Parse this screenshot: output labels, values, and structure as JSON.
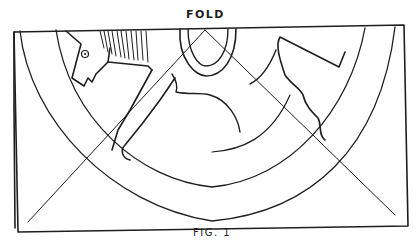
{
  "diagram": {
    "fold_label": "FOLD",
    "figure_caption": "FIG. 1",
    "colors": {
      "ink": "#1e1e1e",
      "paper": "#ffffff"
    },
    "elements": [
      "outer-border-rectangle",
      "back-sheet-edge",
      "outer-arc",
      "middle-arc",
      "inner-arc",
      "top-loop",
      "diagonal-fold-lines",
      "horse-head",
      "horse-mane",
      "horse-legs",
      "right-wavy-shape",
      "fold-label",
      "figure-caption"
    ]
  }
}
